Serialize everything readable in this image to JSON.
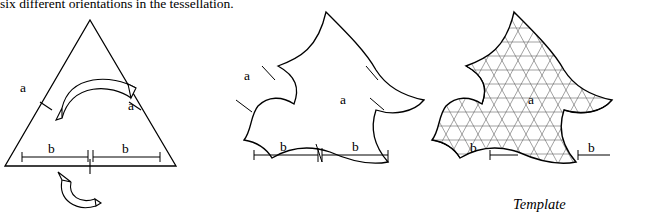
{
  "page": {
    "caption_top": "six different orientations in the tessellation.",
    "template_label": "Template"
  },
  "figures": [
    {
      "id": "triangle",
      "name": "equilateral-triangle-with-arrows",
      "labels": {
        "a_left": "a",
        "a_right": "a",
        "b_left": "b",
        "b_right": "b"
      }
    },
    {
      "id": "curved-tile",
      "name": "curved-escher-tile",
      "labels": {
        "a_left": "a",
        "a_right": "a",
        "b_left": "b",
        "b_right": "b"
      }
    },
    {
      "id": "template-tile",
      "name": "curved-tile-with-triangular-grid",
      "labels": {
        "a_right": "a",
        "b_left": "b",
        "b_right": "b"
      }
    }
  ],
  "colors": {
    "stroke": "#000000",
    "grid": "#555555",
    "background": "#ffffff"
  }
}
